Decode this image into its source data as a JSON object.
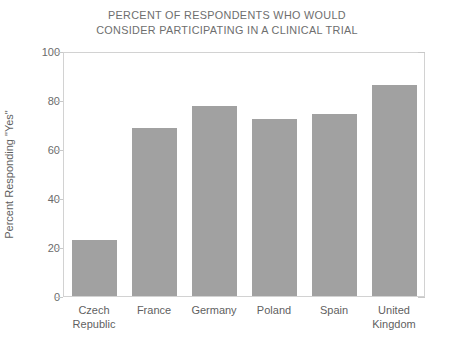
{
  "chart_data": {
    "type": "bar",
    "title": "PERCENT OF RESPONDENTS WHO WOULD CONSIDER PARTICIPATING IN A CLINICAL TRIAL",
    "title_lines": [
      "PERCENT OF RESPONDENTS WHO WOULD",
      "CONSIDER PARTICIPATING IN A CLINICAL TRIAL"
    ],
    "categories": [
      "Czech Republic",
      "France",
      "Germany",
      "Poland",
      "Spain",
      "United Kingdom"
    ],
    "category_lines": [
      [
        "Czech",
        "Republic"
      ],
      [
        "France"
      ],
      [
        "Germany"
      ],
      [
        "Poland"
      ],
      [
        "Spain"
      ],
      [
        "United",
        "Kingdom"
      ]
    ],
    "values": [
      23,
      69,
      78,
      73,
      75,
      87
    ],
    "xlabel": "",
    "ylabel": "Percent Responding \"Yes\"",
    "ylim": [
      0,
      100
    ],
    "yticks": [
      0,
      20,
      40,
      60,
      80,
      100
    ],
    "ytick_labels": [
      "0",
      "20",
      "40",
      "60",
      "80",
      "100"
    ],
    "grid": false,
    "legend": false,
    "bar_color": "#a1a1a1",
    "frame_color": "#d2d2d2",
    "text_color": "#6b6b6b"
  }
}
